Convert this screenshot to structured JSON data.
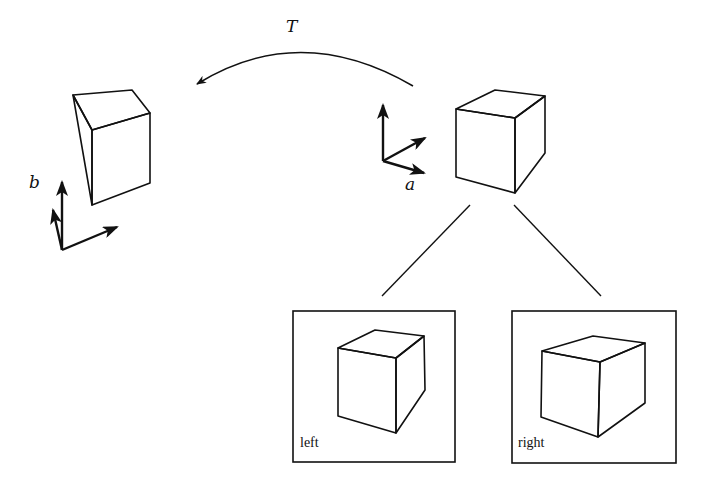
{
  "diagram": {
    "transform_label": "T",
    "frame_a_label": "a",
    "frame_b_label": "b",
    "views": [
      {
        "label": "left"
      },
      {
        "label": "right"
      }
    ]
  },
  "colors": {
    "stroke": "#111111",
    "background": "#ffffff"
  }
}
